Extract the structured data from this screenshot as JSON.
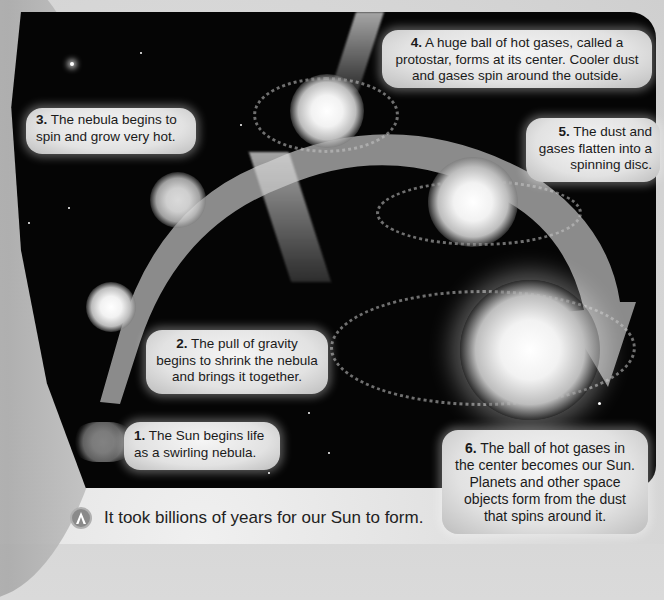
{
  "diagram": {
    "topic": "Formation of the Sun",
    "steps": [
      {
        "number": "1.",
        "text": " The Sun begins life as a swirling nebula."
      },
      {
        "number": "2.",
        "text": " The pull of gravity begins to shrink the nebula and brings it together."
      },
      {
        "number": "3.",
        "text": " The nebula begins to spin and grow very hot."
      },
      {
        "number": "4.",
        "text": "  A huge ball of hot gases, called a protostar, forms at its center. Cooler dust and gases spin around the outside."
      },
      {
        "number": "5.",
        "text": " The dust and gases flatten into a spinning disc."
      },
      {
        "number": "6.",
        "text": " The ball of hot gases in the center becomes our Sun. Planets and other space objects form from the dust that spins around it."
      }
    ],
    "caption": "It took billions of years for our Sun to form.",
    "caption_icon": "triangle-badge-icon",
    "colors": {
      "space_background": "#050505",
      "callout_fill": "#e6e6e6",
      "arrow_fill": "#9a9a9a",
      "page_background": "#dcdcdc",
      "text": "#1a1a1a"
    }
  }
}
